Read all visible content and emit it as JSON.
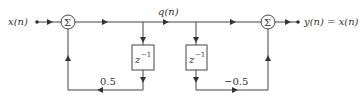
{
  "diagram": {
    "input_label": "x(n)",
    "mid_label": "q(n)",
    "output_label": "y(n) = x(n)",
    "sum_symbol": "Σ",
    "delay1": {
      "base": "z",
      "exp": "−1"
    },
    "delay2": {
      "base": "z",
      "exp": "−1"
    },
    "gain1": "0.5",
    "gain2": "−0.5"
  },
  "colors": {
    "line": "#444444",
    "text": "#333333"
  }
}
